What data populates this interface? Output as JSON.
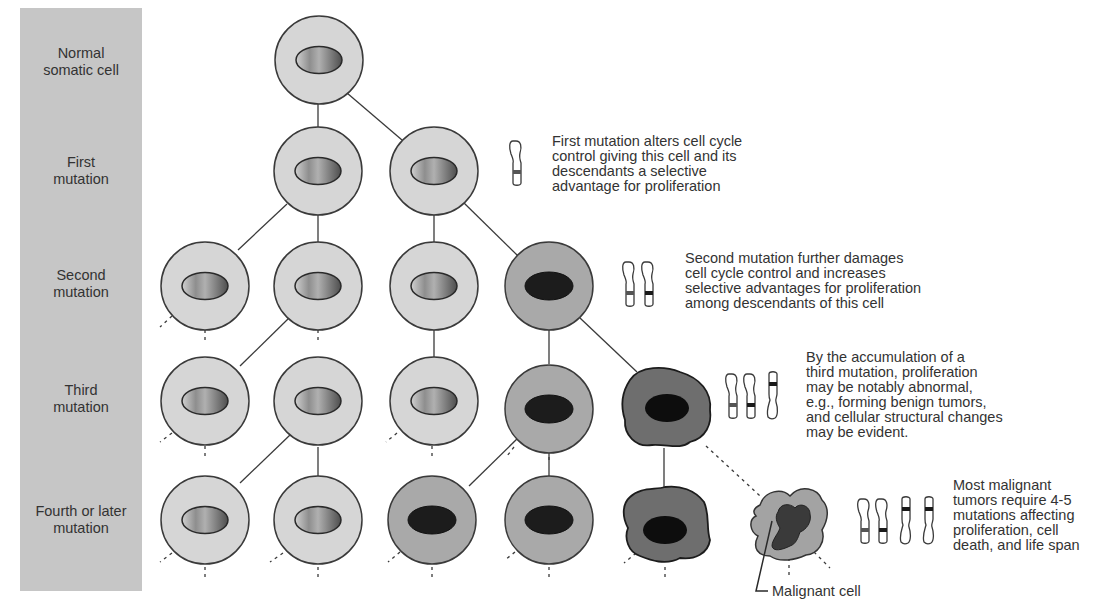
{
  "stages": [
    {
      "label": "Normal\nsomatic cell"
    },
    {
      "label": "First\nmutation"
    },
    {
      "label": "Second\nmutation"
    },
    {
      "label": "Third\nmutation"
    },
    {
      "label": "Fourth or later\nmutation"
    }
  ],
  "annotations": {
    "first": "First mutation alters cell cycle\ncontrol giving this cell and its\ndescendants a selective\nadvantage for proliferation",
    "second": "Second mutation further damages\ncell cycle control and increases\nselective advantages for proliferation\namong descendants of this cell",
    "third": "By the accumulation of a\nthird mutation, proliferation\nmay be notably abnormal,\ne.g., forming benign tumors,\nand cellular structural changes\nmay be evident.",
    "fourth": "Most malignant\ntumors require 4-5\nmutations affecting\nproliferation, cell\ndeath, and life span"
  },
  "malignant_label": "Malignant cell",
  "colors": {
    "panel": "#c6c6c6",
    "normal_cell": "#d6d6d6",
    "mutated_cell": "#a9a9a9",
    "benign_blob": "#6e6e6e",
    "malignant_cytoplasm": "#a3a3a3",
    "dark_nucleus": "#1c1c1c",
    "outline": "#3a3a3a"
  }
}
